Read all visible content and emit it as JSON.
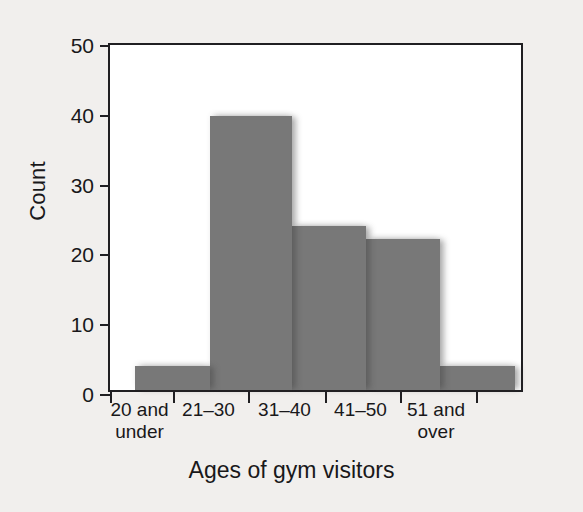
{
  "chart_data": {
    "type": "bar",
    "title": "",
    "xlabel": "Ages of gym visitors",
    "ylabel": "Count",
    "categories": [
      "20 and under",
      "21–30",
      "31–40",
      "41–50",
      "51 and over"
    ],
    "category_lines": [
      [
        "20 and",
        "under"
      ],
      [
        "21–30",
        ""
      ],
      [
        "31–40",
        ""
      ],
      [
        "41–50",
        ""
      ],
      [
        "51 and",
        "over"
      ]
    ],
    "values": [
      3.4,
      39.2,
      23.5,
      21.6,
      3.4
    ],
    "ylim": [
      0,
      50
    ],
    "yticks": [
      0,
      10,
      20,
      30,
      40,
      50
    ],
    "ytick_labels": [
      "0",
      "10",
      "20",
      "30",
      "40",
      "50"
    ],
    "grid": false,
    "legend": false,
    "bar_color": "#787878",
    "axis_color": "#201f22",
    "plot_background": "#ffffff",
    "figure_background": "#f1efed"
  }
}
